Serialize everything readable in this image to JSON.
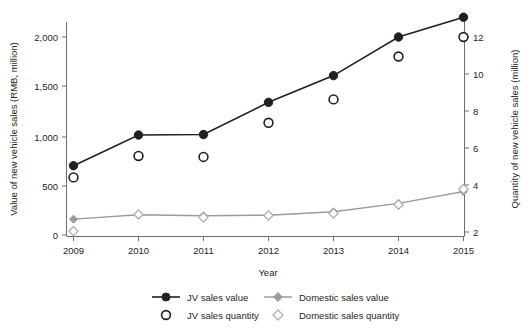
{
  "chart_data": {
    "type": "line",
    "title": "",
    "xlabel": "Year",
    "ylabel": "Value of new vehicle sales (RMB, million)",
    "y2label": "Quantity of new vehicle sales (million)",
    "categories": [
      "2009",
      "2010",
      "2011",
      "2012",
      "2013",
      "2014",
      "2015"
    ],
    "x": [
      2009,
      2010,
      2011,
      2012,
      2013,
      2014,
      2015
    ],
    "ylim": [
      0,
      2200
    ],
    "y2lim": [
      1.6,
      12.4
    ],
    "yticks": [
      0,
      500,
      1000,
      1500,
      2000
    ],
    "yticklabels": [
      "0",
      "500",
      "1,000",
      "1,500",
      "2,000"
    ],
    "y2ticks": [
      2,
      4,
      6,
      8,
      10,
      12
    ],
    "y2ticklabels": [
      "2",
      "4",
      "6",
      "8",
      "10",
      "12"
    ],
    "grid": false,
    "legend_position": "bottom",
    "series": [
      {
        "name": "JV sales value",
        "axis": "left",
        "marker": "filled-circle",
        "color": "#231f20",
        "line": true,
        "values": [
          700,
          1010,
          1015,
          1340,
          1610,
          2000,
          2200
        ]
      },
      {
        "name": "Domestic sales value",
        "axis": "left",
        "marker": "filled-diamond",
        "color": "#9b9b9b",
        "line": true,
        "values": [
          160,
          205,
          195,
          200,
          235,
          320,
          440
        ]
      },
      {
        "name": "JV sales quantity",
        "axis": "right",
        "marker": "open-circle",
        "color": "#231f20",
        "line": false,
        "values": [
          4.8,
          5.9,
          5.85,
          7.6,
          8.8,
          11.0,
          12.0
        ]
      },
      {
        "name": "Domestic sales quantity",
        "axis": "right",
        "marker": "open-diamond",
        "color": "#b0b0b0",
        "line": false,
        "values": [
          2.05,
          2.9,
          2.75,
          2.85,
          2.95,
          3.4,
          4.2
        ]
      }
    ]
  },
  "axes": {
    "y_left_title": "Value of new vehicle sales (RMB, million)",
    "y_right_title": "Quantity of new vehicle sales (million)",
    "x_title": "Year",
    "y_left_ticks": [
      "2,000",
      "1,500",
      "1,000",
      "500",
      "0"
    ],
    "y_right_ticks": [
      "12",
      "10",
      "8",
      "6",
      "4",
      "2"
    ],
    "x_ticks": [
      "2009",
      "2010",
      "2011",
      "2012",
      "2013",
      "2014",
      "2015"
    ]
  },
  "legend": {
    "items": [
      {
        "label": "JV sales value",
        "marker": "filled-circle-line",
        "color": "#231f20"
      },
      {
        "label": "Domestic sales value",
        "marker": "filled-diamond-line",
        "color": "#9b9b9b"
      },
      {
        "label": "JV sales quantity",
        "marker": "open-circle",
        "color": "#231f20"
      },
      {
        "label": "Domestic sales quantity",
        "marker": "open-diamond",
        "color": "#b0b0b0"
      }
    ]
  }
}
